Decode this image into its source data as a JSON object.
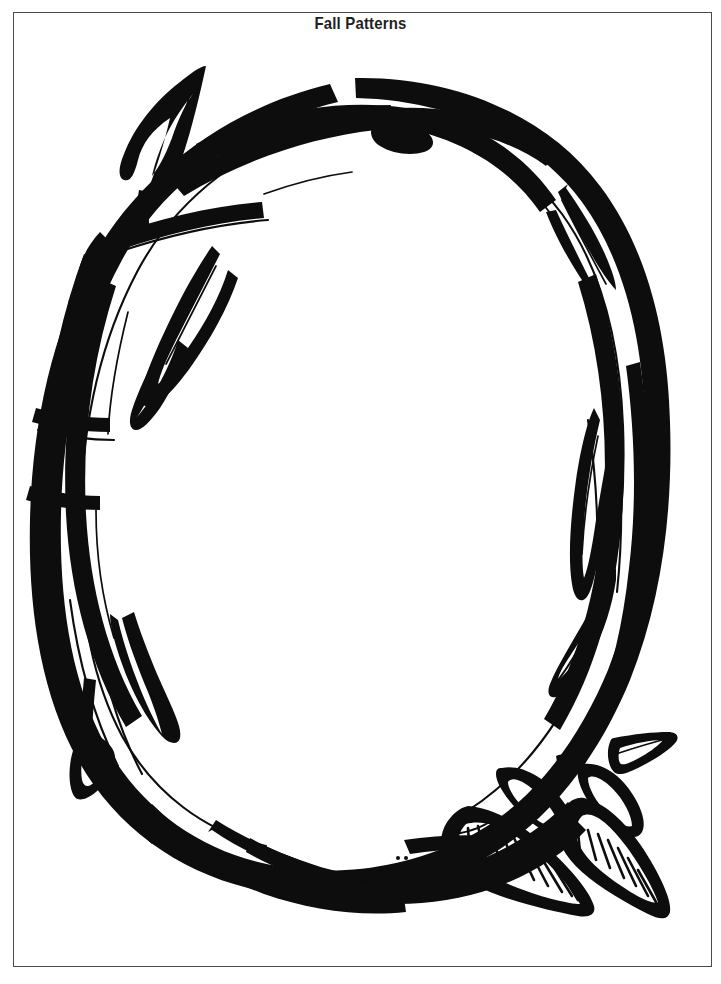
{
  "page": {
    "title": "Fall Patterns",
    "background_color": "#ffffff",
    "border_color": "#4a4a4a",
    "ink_color": "#0d0d0d"
  },
  "artwork": {
    "name": "autumn-vine-wreath",
    "description": "Hand-drawn black outline oval wreath of twisted vines and leaves, coloring-page style, with an empty white oval center",
    "style": "line-art",
    "elements": [
      "oval vine wreath",
      "pointed leaf top-left",
      "diamond leaves left side",
      "hanging teardrop leaf lower-left",
      "broad striated leaves bottom-right",
      "small arrow leaf right"
    ]
  }
}
